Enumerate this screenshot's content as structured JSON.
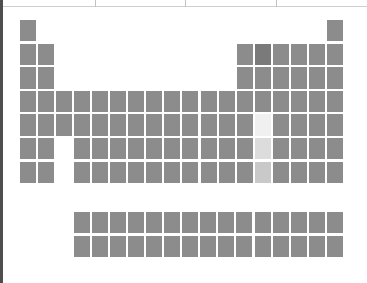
{
  "chart_data": {
    "type": "heatmap",
    "title": "",
    "subtitle": "",
    "xlabel": "",
    "ylabel": "",
    "layout": "periodic-table",
    "grid": false,
    "legend_position": "none",
    "columns": 18,
    "rows": 7,
    "footer_block": {
      "columns": 15,
      "rows": 2,
      "start_column": 4
    },
    "colors": {
      "background": "#ffffff",
      "cell_default": "#8c8c8c",
      "cell_dark": "#7a7a7a",
      "cell_highlight_light": "#f0f0f0",
      "cell_highlight_mid": "#dcdcdc",
      "cell_highlight_deep": "#c9c9c9",
      "frame_line": "#cfcfcf",
      "edge_line": "#4e4e4e"
    },
    "value_range": [
      0,
      1
    ],
    "cells": [
      {
        "name": "cell-r1-c1",
        "row": 1,
        "col": 1,
        "value": 0.5,
        "shade": "default"
      },
      {
        "name": "cell-r1-c18",
        "row": 1,
        "col": 18,
        "value": 0.5,
        "shade": "default"
      },
      {
        "name": "cell-r2-c1",
        "row": 2,
        "col": 1,
        "value": 0.5,
        "shade": "default"
      },
      {
        "name": "cell-r2-c2",
        "row": 2,
        "col": 2,
        "value": 0.5,
        "shade": "default"
      },
      {
        "name": "cell-r2-c13",
        "row": 2,
        "col": 13,
        "value": 0.5,
        "shade": "default"
      },
      {
        "name": "cell-r2-c14",
        "row": 2,
        "col": 14,
        "value": 0.62,
        "shade": "dark"
      },
      {
        "name": "cell-r2-c15",
        "row": 2,
        "col": 15,
        "value": 0.5,
        "shade": "default"
      },
      {
        "name": "cell-r2-c16",
        "row": 2,
        "col": 16,
        "value": 0.5,
        "shade": "default"
      },
      {
        "name": "cell-r2-c17",
        "row": 2,
        "col": 17,
        "value": 0.5,
        "shade": "default"
      },
      {
        "name": "cell-r2-c18",
        "row": 2,
        "col": 18,
        "value": 0.5,
        "shade": "default"
      },
      {
        "name": "cell-r3-c1",
        "row": 3,
        "col": 1,
        "value": 0.5,
        "shade": "default"
      },
      {
        "name": "cell-r3-c2",
        "row": 3,
        "col": 2,
        "value": 0.5,
        "shade": "default"
      },
      {
        "name": "cell-r3-c13",
        "row": 3,
        "col": 13,
        "value": 0.5,
        "shade": "default"
      },
      {
        "name": "cell-r3-c14",
        "row": 3,
        "col": 14,
        "value": 0.5,
        "shade": "default"
      },
      {
        "name": "cell-r3-c15",
        "row": 3,
        "col": 15,
        "value": 0.5,
        "shade": "default"
      },
      {
        "name": "cell-r3-c16",
        "row": 3,
        "col": 16,
        "value": 0.5,
        "shade": "default"
      },
      {
        "name": "cell-r3-c17",
        "row": 3,
        "col": 17,
        "value": 0.5,
        "shade": "default"
      },
      {
        "name": "cell-r3-c18",
        "row": 3,
        "col": 18,
        "value": 0.5,
        "shade": "default"
      },
      {
        "name": "cell-r4-c1",
        "row": 4,
        "col": 1,
        "value": 0.5,
        "shade": "default"
      },
      {
        "name": "cell-r4-c2",
        "row": 4,
        "col": 2,
        "value": 0.5,
        "shade": "default"
      },
      {
        "name": "cell-r4-c3",
        "row": 4,
        "col": 3,
        "value": 0.5,
        "shade": "default"
      },
      {
        "name": "cell-r4-c4",
        "row": 4,
        "col": 4,
        "value": 0.5,
        "shade": "default"
      },
      {
        "name": "cell-r4-c5",
        "row": 4,
        "col": 5,
        "value": 0.5,
        "shade": "default"
      },
      {
        "name": "cell-r4-c6",
        "row": 4,
        "col": 6,
        "value": 0.5,
        "shade": "default"
      },
      {
        "name": "cell-r4-c7",
        "row": 4,
        "col": 7,
        "value": 0.5,
        "shade": "default"
      },
      {
        "name": "cell-r4-c8",
        "row": 4,
        "col": 8,
        "value": 0.5,
        "shade": "default"
      },
      {
        "name": "cell-r4-c9",
        "row": 4,
        "col": 9,
        "value": 0.5,
        "shade": "default"
      },
      {
        "name": "cell-r4-c10",
        "row": 4,
        "col": 10,
        "value": 0.5,
        "shade": "default"
      },
      {
        "name": "cell-r4-c11",
        "row": 4,
        "col": 11,
        "value": 0.5,
        "shade": "default"
      },
      {
        "name": "cell-r4-c12",
        "row": 4,
        "col": 12,
        "value": 0.5,
        "shade": "default"
      },
      {
        "name": "cell-r4-c13",
        "row": 4,
        "col": 13,
        "value": 0.5,
        "shade": "default"
      },
      {
        "name": "cell-r4-c14",
        "row": 4,
        "col": 14,
        "value": 0.5,
        "shade": "default"
      },
      {
        "name": "cell-r4-c15",
        "row": 4,
        "col": 15,
        "value": 0.5,
        "shade": "default"
      },
      {
        "name": "cell-r4-c16",
        "row": 4,
        "col": 16,
        "value": 0.5,
        "shade": "default"
      },
      {
        "name": "cell-r4-c17",
        "row": 4,
        "col": 17,
        "value": 0.5,
        "shade": "default"
      },
      {
        "name": "cell-r4-c18",
        "row": 4,
        "col": 18,
        "value": 0.5,
        "shade": "default"
      },
      {
        "name": "cell-r5-c1",
        "row": 5,
        "col": 1,
        "value": 0.5,
        "shade": "default"
      },
      {
        "name": "cell-r5-c2",
        "row": 5,
        "col": 2,
        "value": 0.5,
        "shade": "default"
      },
      {
        "name": "cell-r5-c3",
        "row": 5,
        "col": 3,
        "value": 0.5,
        "shade": "default"
      },
      {
        "name": "cell-r5-c4",
        "row": 5,
        "col": 4,
        "value": 0.5,
        "shade": "default"
      },
      {
        "name": "cell-r5-c5",
        "row": 5,
        "col": 5,
        "value": 0.5,
        "shade": "default"
      },
      {
        "name": "cell-r5-c6",
        "row": 5,
        "col": 6,
        "value": 0.5,
        "shade": "default"
      },
      {
        "name": "cell-r5-c7",
        "row": 5,
        "col": 7,
        "value": 0.5,
        "shade": "default"
      },
      {
        "name": "cell-r5-c8",
        "row": 5,
        "col": 8,
        "value": 0.5,
        "shade": "default"
      },
      {
        "name": "cell-r5-c9",
        "row": 5,
        "col": 9,
        "value": 0.5,
        "shade": "default"
      },
      {
        "name": "cell-r5-c10",
        "row": 5,
        "col": 10,
        "value": 0.5,
        "shade": "default"
      },
      {
        "name": "cell-r5-c11",
        "row": 5,
        "col": 11,
        "value": 0.5,
        "shade": "default"
      },
      {
        "name": "cell-r5-c12",
        "row": 5,
        "col": 12,
        "value": 0.5,
        "shade": "default"
      },
      {
        "name": "cell-r5-c13",
        "row": 5,
        "col": 13,
        "value": 0.5,
        "shade": "default"
      },
      {
        "name": "cell-r5-c14",
        "row": 5,
        "col": 14,
        "value": 0.05,
        "shade": "highlight-light"
      },
      {
        "name": "cell-r5-c15",
        "row": 5,
        "col": 15,
        "value": 0.5,
        "shade": "default"
      },
      {
        "name": "cell-r5-c16",
        "row": 5,
        "col": 16,
        "value": 0.5,
        "shade": "default"
      },
      {
        "name": "cell-r5-c17",
        "row": 5,
        "col": 17,
        "value": 0.5,
        "shade": "default"
      },
      {
        "name": "cell-r5-c18",
        "row": 5,
        "col": 18,
        "value": 0.5,
        "shade": "default"
      },
      {
        "name": "cell-r6-c1",
        "row": 6,
        "col": 1,
        "value": 0.5,
        "shade": "default"
      },
      {
        "name": "cell-r6-c2",
        "row": 6,
        "col": 2,
        "value": 0.5,
        "shade": "default"
      },
      {
        "name": "cell-r6-c4",
        "row": 6,
        "col": 4,
        "value": 0.5,
        "shade": "default"
      },
      {
        "name": "cell-r6-c5",
        "row": 6,
        "col": 5,
        "value": 0.5,
        "shade": "default"
      },
      {
        "name": "cell-r6-c6",
        "row": 6,
        "col": 6,
        "value": 0.5,
        "shade": "default"
      },
      {
        "name": "cell-r6-c7",
        "row": 6,
        "col": 7,
        "value": 0.5,
        "shade": "default"
      },
      {
        "name": "cell-r6-c8",
        "row": 6,
        "col": 8,
        "value": 0.5,
        "shade": "default"
      },
      {
        "name": "cell-r6-c9",
        "row": 6,
        "col": 9,
        "value": 0.5,
        "shade": "default"
      },
      {
        "name": "cell-r6-c10",
        "row": 6,
        "col": 10,
        "value": 0.5,
        "shade": "default"
      },
      {
        "name": "cell-r6-c11",
        "row": 6,
        "col": 11,
        "value": 0.5,
        "shade": "default"
      },
      {
        "name": "cell-r6-c12",
        "row": 6,
        "col": 12,
        "value": 0.5,
        "shade": "default"
      },
      {
        "name": "cell-r6-c13",
        "row": 6,
        "col": 13,
        "value": 0.5,
        "shade": "default"
      },
      {
        "name": "cell-r6-c14",
        "row": 6,
        "col": 14,
        "value": 0.12,
        "shade": "highlight-mid"
      },
      {
        "name": "cell-r6-c15",
        "row": 6,
        "col": 15,
        "value": 0.5,
        "shade": "default"
      },
      {
        "name": "cell-r6-c16",
        "row": 6,
        "col": 16,
        "value": 0.5,
        "shade": "default"
      },
      {
        "name": "cell-r6-c17",
        "row": 6,
        "col": 17,
        "value": 0.5,
        "shade": "default"
      },
      {
        "name": "cell-r6-c18",
        "row": 6,
        "col": 18,
        "value": 0.5,
        "shade": "default"
      },
      {
        "name": "cell-r7-c1",
        "row": 7,
        "col": 1,
        "value": 0.5,
        "shade": "default"
      },
      {
        "name": "cell-r7-c2",
        "row": 7,
        "col": 2,
        "value": 0.5,
        "shade": "default"
      },
      {
        "name": "cell-r7-c4",
        "row": 7,
        "col": 4,
        "value": 0.5,
        "shade": "default"
      },
      {
        "name": "cell-r7-c5",
        "row": 7,
        "col": 5,
        "value": 0.5,
        "shade": "default"
      },
      {
        "name": "cell-r7-c6",
        "row": 7,
        "col": 6,
        "value": 0.5,
        "shade": "default"
      },
      {
        "name": "cell-r7-c7",
        "row": 7,
        "col": 7,
        "value": 0.5,
        "shade": "default"
      },
      {
        "name": "cell-r7-c8",
        "row": 7,
        "col": 8,
        "value": 0.5,
        "shade": "default"
      },
      {
        "name": "cell-r7-c9",
        "row": 7,
        "col": 9,
        "value": 0.5,
        "shade": "default"
      },
      {
        "name": "cell-r7-c10",
        "row": 7,
        "col": 10,
        "value": 0.5,
        "shade": "default"
      },
      {
        "name": "cell-r7-c11",
        "row": 7,
        "col": 11,
        "value": 0.5,
        "shade": "default"
      },
      {
        "name": "cell-r7-c12",
        "row": 7,
        "col": 12,
        "value": 0.5,
        "shade": "default"
      },
      {
        "name": "cell-r7-c13",
        "row": 7,
        "col": 13,
        "value": 0.5,
        "shade": "default"
      },
      {
        "name": "cell-r7-c14",
        "row": 7,
        "col": 14,
        "value": 0.22,
        "shade": "highlight-deep"
      },
      {
        "name": "cell-r7-c15",
        "row": 7,
        "col": 15,
        "value": 0.5,
        "shade": "default"
      },
      {
        "name": "cell-r7-c16",
        "row": 7,
        "col": 16,
        "value": 0.5,
        "shade": "default"
      },
      {
        "name": "cell-r7-c17",
        "row": 7,
        "col": 17,
        "value": 0.5,
        "shade": "default"
      },
      {
        "name": "cell-r7-c18",
        "row": 7,
        "col": 18,
        "value": 0.5,
        "shade": "default"
      }
    ],
    "footer_cells": [
      {
        "name": "cell-f1-c1",
        "block": 1,
        "col": 1,
        "value": 0.5,
        "shade": "default"
      },
      {
        "name": "cell-f1-c2",
        "block": 1,
        "col": 2,
        "value": 0.5,
        "shade": "default"
      },
      {
        "name": "cell-f1-c3",
        "block": 1,
        "col": 3,
        "value": 0.5,
        "shade": "default"
      },
      {
        "name": "cell-f1-c4",
        "block": 1,
        "col": 4,
        "value": 0.5,
        "shade": "default"
      },
      {
        "name": "cell-f1-c5",
        "block": 1,
        "col": 5,
        "value": 0.5,
        "shade": "default"
      },
      {
        "name": "cell-f1-c6",
        "block": 1,
        "col": 6,
        "value": 0.5,
        "shade": "default"
      },
      {
        "name": "cell-f1-c7",
        "block": 1,
        "col": 7,
        "value": 0.5,
        "shade": "default"
      },
      {
        "name": "cell-f1-c8",
        "block": 1,
        "col": 8,
        "value": 0.5,
        "shade": "default"
      },
      {
        "name": "cell-f1-c9",
        "block": 1,
        "col": 9,
        "value": 0.5,
        "shade": "default"
      },
      {
        "name": "cell-f1-c10",
        "block": 1,
        "col": 10,
        "value": 0.5,
        "shade": "default"
      },
      {
        "name": "cell-f1-c11",
        "block": 1,
        "col": 11,
        "value": 0.5,
        "shade": "default"
      },
      {
        "name": "cell-f1-c12",
        "block": 1,
        "col": 12,
        "value": 0.5,
        "shade": "default"
      },
      {
        "name": "cell-f1-c13",
        "block": 1,
        "col": 13,
        "value": 0.5,
        "shade": "default"
      },
      {
        "name": "cell-f1-c14",
        "block": 1,
        "col": 14,
        "value": 0.5,
        "shade": "default"
      },
      {
        "name": "cell-f1-c15",
        "block": 1,
        "col": 15,
        "value": 0.5,
        "shade": "default"
      },
      {
        "name": "cell-f2-c1",
        "block": 2,
        "col": 1,
        "value": 0.5,
        "shade": "default"
      },
      {
        "name": "cell-f2-c2",
        "block": 2,
        "col": 2,
        "value": 0.5,
        "shade": "default"
      },
      {
        "name": "cell-f2-c3",
        "block": 2,
        "col": 3,
        "value": 0.5,
        "shade": "default"
      },
      {
        "name": "cell-f2-c4",
        "block": 2,
        "col": 4,
        "value": 0.5,
        "shade": "default"
      },
      {
        "name": "cell-f2-c5",
        "block": 2,
        "col": 5,
        "value": 0.5,
        "shade": "default"
      },
      {
        "name": "cell-f2-c6",
        "block": 2,
        "col": 6,
        "value": 0.5,
        "shade": "default"
      },
      {
        "name": "cell-f2-c7",
        "block": 2,
        "col": 7,
        "value": 0.5,
        "shade": "default"
      },
      {
        "name": "cell-f2-c8",
        "block": 2,
        "col": 8,
        "value": 0.5,
        "shade": "default"
      },
      {
        "name": "cell-f2-c9",
        "block": 2,
        "col": 9,
        "value": 0.5,
        "shade": "default"
      },
      {
        "name": "cell-f2-c10",
        "block": 2,
        "col": 10,
        "value": 0.5,
        "shade": "default"
      },
      {
        "name": "cell-f2-c11",
        "block": 2,
        "col": 11,
        "value": 0.5,
        "shade": "default"
      },
      {
        "name": "cell-f2-c12",
        "block": 2,
        "col": 12,
        "value": 0.5,
        "shade": "default"
      },
      {
        "name": "cell-f2-c13",
        "block": 2,
        "col": 13,
        "value": 0.5,
        "shade": "default"
      },
      {
        "name": "cell-f2-c14",
        "block": 2,
        "col": 14,
        "value": 0.5,
        "shade": "default"
      },
      {
        "name": "cell-f2-c15",
        "block": 2,
        "col": 15,
        "value": 0.5,
        "shade": "default"
      }
    ],
    "frame": {
      "top_rule_y": 6,
      "tick_positions": [
        95,
        185,
        276
      ]
    }
  },
  "geometry": {
    "main_origin_x": 20,
    "main_origin_y": 20,
    "col_pitch": 18.05,
    "row_pitch": 23.6,
    "cell_w": 16.0,
    "cell_h": 21.4,
    "footer_origin_x": 74,
    "footer_origin_y": 212,
    "footer_col_pitch": 18.05,
    "footer_row_pitch": 23.6
  }
}
